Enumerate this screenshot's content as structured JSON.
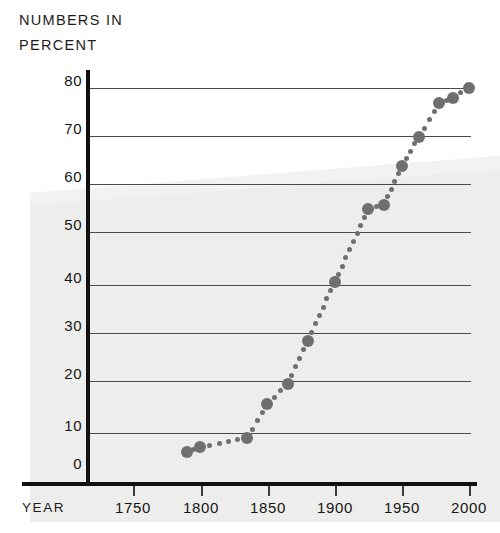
{
  "title": {
    "line1": "NUMBERS IN",
    "line2": "PERCENT"
  },
  "axis": {
    "x_name": "YEAR",
    "y_ticks": [
      "80",
      "70",
      "60",
      "50",
      "40",
      "30",
      "20",
      "10",
      "0"
    ],
    "x_ticks": [
      "1750",
      "1800",
      "1850",
      "1900",
      "1950",
      "2000"
    ]
  },
  "colors": {
    "marker": "#6f6f6f",
    "gridline": "#4a4a4a",
    "axis": "#111111",
    "backdrop": "#eeeeee",
    "text": "#1a1a1a"
  },
  "chart_data": {
    "type": "scatter",
    "title": "NUMBERS IN PERCENT",
    "xlabel": "YEAR",
    "ylabel": "NUMBERS IN PERCENT",
    "xlim": [
      1700,
      2010
    ],
    "ylim": [
      0,
      83
    ],
    "grid": true,
    "legend": null,
    "xticks": [
      1750,
      1800,
      1850,
      1900,
      1950,
      2000
    ],
    "yticks": [
      0,
      10,
      20,
      30,
      40,
      50,
      60,
      70,
      80
    ],
    "series": [
      {
        "name": "Percent",
        "points": [
          {
            "x": 1790,
            "y": 5
          },
          {
            "x": 1800,
            "y": 6
          },
          {
            "x": 1835,
            "y": 8
          },
          {
            "x": 1850,
            "y": 15
          },
          {
            "x": 1865,
            "y": 19
          },
          {
            "x": 1880,
            "y": 28
          },
          {
            "x": 1900,
            "y": 40
          },
          {
            "x": 1925,
            "y": 55
          },
          {
            "x": 1937,
            "y": 56
          },
          {
            "x": 1950,
            "y": 64
          },
          {
            "x": 1963,
            "y": 70
          },
          {
            "x": 1978,
            "y": 77
          },
          {
            "x": 1988,
            "y": 78
          },
          {
            "x": 2000,
            "y": 80
          }
        ]
      }
    ]
  }
}
